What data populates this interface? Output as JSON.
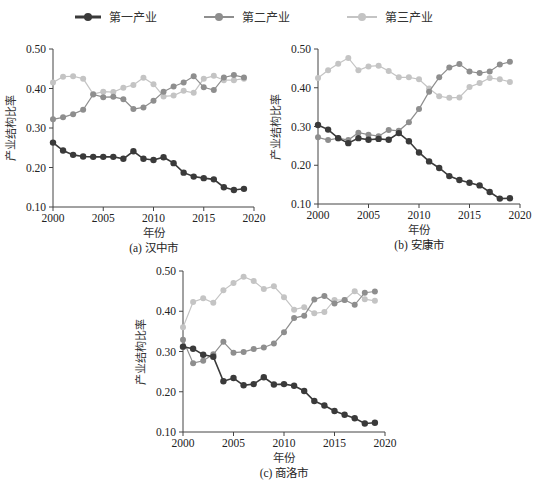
{
  "legend": {
    "items": [
      {
        "label": "第一产业",
        "color": "#3a3a3a"
      },
      {
        "label": "第二产业",
        "color": "#8e8e8e"
      },
      {
        "label": "第三产业",
        "color": "#c4c4c4"
      }
    ]
  },
  "chart_data": [
    {
      "type": "line",
      "title": "(a) 汉中市",
      "xlabel": "年份",
      "ylabel": "产业结构比率",
      "xlim": [
        2000,
        2020
      ],
      "ylim": [
        0.1,
        0.5
      ],
      "xticks": [
        "2000",
        "2005",
        "2010",
        "2015",
        "2020"
      ],
      "yticks": [
        "0.10",
        "0.20",
        "0.30",
        "0.40",
        "0.50"
      ],
      "grid": false,
      "x": [
        2000,
        2001,
        2002,
        2003,
        2004,
        2005,
        2006,
        2007,
        2008,
        2009,
        2010,
        2011,
        2012,
        2013,
        2014,
        2015,
        2016,
        2017,
        2018,
        2019
      ],
      "series": [
        {
          "name": "第一产业",
          "values": [
            0.263,
            0.243,
            0.232,
            0.228,
            0.227,
            0.227,
            0.227,
            0.222,
            0.241,
            0.222,
            0.219,
            0.226,
            0.211,
            0.187,
            0.177,
            0.173,
            0.17,
            0.15,
            0.143,
            0.146
          ]
        },
        {
          "name": "第二产业",
          "values": [
            0.322,
            0.327,
            0.335,
            0.346,
            0.385,
            0.378,
            0.379,
            0.373,
            0.348,
            0.352,
            0.369,
            0.392,
            0.405,
            0.415,
            0.431,
            0.403,
            0.396,
            0.428,
            0.434,
            0.428
          ]
        },
        {
          "name": "第三产业",
          "values": [
            0.415,
            0.43,
            0.431,
            0.425,
            0.386,
            0.392,
            0.391,
            0.402,
            0.409,
            0.427,
            0.411,
            0.38,
            0.382,
            0.394,
            0.389,
            0.425,
            0.432,
            0.421,
            0.421,
            0.425
          ]
        }
      ]
    },
    {
      "type": "line",
      "title": "(b) 安康市",
      "xlabel": "年份",
      "ylabel": "产业结构比率",
      "xlim": [
        2000,
        2020
      ],
      "ylim": [
        0.1,
        0.5
      ],
      "xticks": [
        "2000",
        "2005",
        "2010",
        "2015",
        "2020"
      ],
      "yticks": [
        "0.10",
        "0.20",
        "0.30",
        "0.40",
        "0.50"
      ],
      "grid": false,
      "x": [
        2000,
        2001,
        2002,
        2003,
        2004,
        2005,
        2006,
        2007,
        2008,
        2009,
        2010,
        2011,
        2012,
        2013,
        2014,
        2015,
        2016,
        2017,
        2018,
        2019
      ],
      "series": [
        {
          "name": "第一产业",
          "values": [
            0.304,
            0.292,
            0.27,
            0.257,
            0.27,
            0.266,
            0.268,
            0.266,
            0.283,
            0.262,
            0.233,
            0.21,
            0.193,
            0.172,
            0.162,
            0.155,
            0.148,
            0.131,
            0.114,
            0.115
          ]
        },
        {
          "name": "第二产业",
          "values": [
            0.272,
            0.265,
            0.27,
            0.265,
            0.284,
            0.279,
            0.275,
            0.291,
            0.289,
            0.311,
            0.345,
            0.39,
            0.427,
            0.452,
            0.461,
            0.442,
            0.438,
            0.442,
            0.46,
            0.467
          ]
        },
        {
          "name": "第三产业",
          "values": [
            0.425,
            0.445,
            0.462,
            0.477,
            0.445,
            0.455,
            0.457,
            0.443,
            0.427,
            0.427,
            0.422,
            0.398,
            0.378,
            0.374,
            0.375,
            0.402,
            0.412,
            0.425,
            0.422,
            0.415
          ]
        }
      ]
    },
    {
      "type": "line",
      "title": "(c) 商洛市",
      "xlabel": "年份",
      "ylabel": "产业结构比率",
      "xlim": [
        2000,
        2020
      ],
      "ylim": [
        0.1,
        0.5
      ],
      "xticks": [
        "2000",
        "2005",
        "2010",
        "2015",
        "2020"
      ],
      "yticks": [
        "0.10",
        "0.20",
        "0.30",
        "0.40",
        "0.50"
      ],
      "grid": false,
      "x": [
        2000,
        2001,
        2002,
        2003,
        2004,
        2005,
        2006,
        2007,
        2008,
        2009,
        2010,
        2011,
        2012,
        2013,
        2014,
        2015,
        2016,
        2017,
        2018,
        2019
      ],
      "series": [
        {
          "name": "第一产业",
          "values": [
            0.312,
            0.307,
            0.292,
            0.287,
            0.226,
            0.234,
            0.216,
            0.219,
            0.236,
            0.218,
            0.219,
            0.215,
            0.202,
            0.177,
            0.166,
            0.152,
            0.143,
            0.134,
            0.121,
            0.123
          ]
        },
        {
          "name": "第二产业",
          "values": [
            0.329,
            0.271,
            0.277,
            0.293,
            0.324,
            0.297,
            0.299,
            0.306,
            0.31,
            0.32,
            0.348,
            0.383,
            0.389,
            0.429,
            0.438,
            0.419,
            0.428,
            0.416,
            0.446,
            0.449
          ]
        },
        {
          "name": "第三产业",
          "values": [
            0.36,
            0.423,
            0.432,
            0.421,
            0.452,
            0.47,
            0.486,
            0.475,
            0.455,
            0.462,
            0.435,
            0.404,
            0.41,
            0.395,
            0.398,
            0.428,
            0.428,
            0.45,
            0.43,
            0.426
          ]
        }
      ]
    }
  ],
  "layout": {
    "charts": [
      {
        "x0": 53,
        "x1": 254,
        "y_top": 49,
        "y_bottom": 207
      },
      {
        "x0": 318,
        "x1": 520,
        "y_top": 49,
        "y_bottom": 204
      },
      {
        "x0": 183,
        "x1": 385,
        "y_top": 271,
        "y_bottom": 432
      }
    ]
  }
}
